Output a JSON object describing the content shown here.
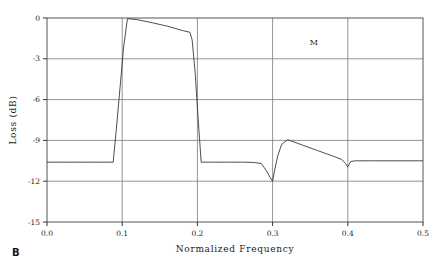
{
  "figure": {
    "panel_label": "B",
    "background_color": "#ffffff",
    "frame_color": "#555555",
    "grid_color": "#777777",
    "curve_color": "#3a3a3a"
  },
  "chart_data": {
    "type": "line",
    "title": "",
    "xlabel": "Normalized Frequency",
    "ylabel": "Loss (dB)",
    "xlim": [
      0.0,
      0.5
    ],
    "ylim": [
      -15,
      0
    ],
    "grid": true,
    "legend": false,
    "xticks": [
      0.0,
      0.1,
      0.2,
      0.3,
      0.4,
      0.5
    ],
    "xtick_labels": [
      "0.0",
      "0.1",
      "0.2",
      "0.3",
      "0.4",
      "0.5"
    ],
    "yticks": [
      0,
      -3,
      -6,
      -9,
      -12,
      -15
    ],
    "ytick_labels": [
      "0",
      "-3",
      "-6",
      "-9",
      "-12",
      "-15"
    ],
    "annotations": [
      {
        "text": "M",
        "x": 0.355,
        "y": -2.0
      }
    ],
    "series": [
      {
        "name": "loss-response",
        "x": [
          0.0,
          0.02,
          0.04,
          0.06,
          0.08,
          0.088,
          0.092,
          0.097,
          0.102,
          0.107,
          0.12,
          0.14,
          0.16,
          0.18,
          0.19,
          0.193,
          0.197,
          0.201,
          0.205,
          0.22,
          0.24,
          0.26,
          0.275,
          0.285,
          0.292,
          0.297,
          0.3,
          0.303,
          0.307,
          0.312,
          0.32,
          0.34,
          0.36,
          0.38,
          0.392,
          0.397,
          0.4,
          0.404,
          0.41,
          0.43,
          0.46,
          0.5
        ],
        "y": [
          -10.6,
          -10.6,
          -10.6,
          -10.6,
          -10.6,
          -10.6,
          -8.3,
          -5.2,
          -2.1,
          -0.05,
          -0.12,
          -0.35,
          -0.6,
          -0.92,
          -1.05,
          -1.6,
          -4.0,
          -7.4,
          -10.6,
          -10.6,
          -10.6,
          -10.6,
          -10.62,
          -10.7,
          -11.25,
          -11.75,
          -12.0,
          -11.1,
          -10.1,
          -9.3,
          -8.95,
          -9.35,
          -9.75,
          -10.15,
          -10.4,
          -10.7,
          -10.95,
          -10.55,
          -10.5,
          -10.5,
          -10.5,
          -10.5
        ]
      }
    ]
  }
}
